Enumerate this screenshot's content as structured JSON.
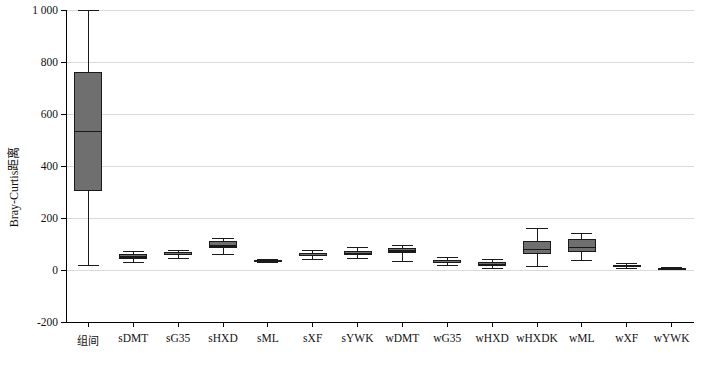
{
  "chart_data": {
    "type": "box",
    "title": "",
    "xlabel": "",
    "ylabel": "Bray-Curtis距离",
    "ylim": [
      -200,
      1000
    ],
    "yticks": [
      -200,
      0,
      200,
      400,
      600,
      800,
      1000
    ],
    "ytick_labels": [
      "-200",
      "0",
      "200",
      "400",
      "600",
      "800",
      "1 000"
    ],
    "grid": "horizontal",
    "categories": [
      "组间",
      "sDMT",
      "sG35",
      "sHXD",
      "sML",
      "sXF",
      "sYWK",
      "wDMT",
      "wG35",
      "wHXD",
      "wHXDK",
      "wML",
      "wXF",
      "wYWK"
    ],
    "boxes": [
      {
        "category": "组间",
        "whisker_low": 20,
        "q1": 303,
        "median": 535,
        "q3": 762,
        "whisker_high": 1000
      },
      {
        "category": "sDMT",
        "whisker_low": 30,
        "q1": 42,
        "median": 52,
        "q3": 62,
        "whisker_high": 75
      },
      {
        "category": "sG35",
        "whisker_low": 48,
        "q1": 56,
        "median": 62,
        "q3": 68,
        "whisker_high": 76
      },
      {
        "category": "sHXD",
        "whisker_low": 62,
        "q1": 85,
        "median": 96,
        "q3": 110,
        "whisker_high": 125
      },
      {
        "category": "sML",
        "whisker_low": 31,
        "q1": 34,
        "median": 36,
        "q3": 38,
        "whisker_high": 41
      },
      {
        "category": "sXF",
        "whisker_low": 44,
        "q1": 52,
        "median": 58,
        "q3": 64,
        "whisker_high": 78
      },
      {
        "category": "sYWK",
        "whisker_low": 45,
        "q1": 58,
        "median": 66,
        "q3": 72,
        "whisker_high": 88
      },
      {
        "category": "wDMT",
        "whisker_low": 33,
        "q1": 65,
        "median": 76,
        "q3": 86,
        "whisker_high": 96
      },
      {
        "category": "wG35",
        "whisker_low": 20,
        "q1": 27,
        "median": 32,
        "q3": 38,
        "whisker_high": 49
      },
      {
        "category": "wHXD",
        "whisker_low": 8,
        "q1": 16,
        "median": 22,
        "q3": 29,
        "whisker_high": 42
      },
      {
        "category": "wHXDK",
        "whisker_low": 14,
        "q1": 62,
        "median": 82,
        "q3": 113,
        "whisker_high": 160
      },
      {
        "category": "wML",
        "whisker_low": 38,
        "q1": 68,
        "median": 90,
        "q3": 118,
        "whisker_high": 143
      },
      {
        "category": "wXF",
        "whisker_low": 8,
        "q1": 12,
        "median": 16,
        "q3": 20,
        "whisker_high": 26
      },
      {
        "category": "wYWK",
        "whisker_low": 2,
        "q1": 4,
        "median": 6,
        "q3": 8,
        "whisker_high": 11
      }
    ],
    "colors": {
      "box_fill": "#6f6f6f",
      "box_edge": "#1a1a1a",
      "grid": "#d9d9d9",
      "axis": "#000000"
    }
  }
}
